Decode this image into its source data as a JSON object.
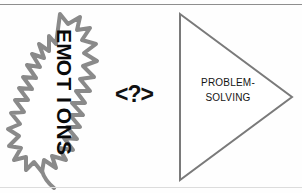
{
  "diagram": {
    "background_color": "#fefefe",
    "rules": {
      "top_color": "#8e8e8e",
      "bottom_color": "#dcdcdc"
    },
    "left_shape": {
      "name": "emotions-blob",
      "shape": "jagged-spiky-outline",
      "outline_color": "#808080",
      "fill_color": "#ffffff",
      "label_text": "EMOTIONS",
      "label_color": "#0a0a0a",
      "letters": [
        "E",
        "M",
        "O",
        "T",
        "I",
        "O",
        "N",
        "S"
      ],
      "orientation": "vertical-stacked-rotated"
    },
    "connector": {
      "name": "question-connector",
      "text": "<?>",
      "color": "#111111"
    },
    "right_shape": {
      "name": "problem-solving-triangle",
      "shape": "triangle-pointing-right",
      "outline_color": "#7a7a7a",
      "fill_color": "#ffffff",
      "line1": "PROBLEM-",
      "line2": "SOLVING",
      "label_color": "#141414"
    }
  }
}
